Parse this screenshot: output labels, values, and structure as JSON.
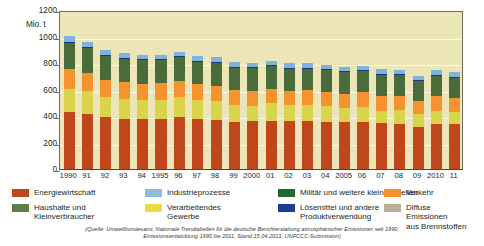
{
  "chart_data": {
    "type": "bar",
    "stacked": true,
    "title": "",
    "subtitle": "",
    "xlabel": "",
    "ylabel": "Mio. t",
    "ylim": [
      0,
      1200
    ],
    "yticks": [
      0,
      200,
      400,
      600,
      800,
      1000,
      1200
    ],
    "ytick_labels": [
      "0",
      "200",
      "400",
      "600",
      "800",
      "1000",
      "1200"
    ],
    "grid": true,
    "legend_position": "bottom",
    "categories": [
      "1990",
      "91",
      "92",
      "93",
      "94",
      "1995",
      "96",
      "97",
      "98",
      "99",
      "2000",
      "01",
      "02",
      "03",
      "04",
      "2005",
      "06",
      "07",
      "08",
      "09",
      "2010",
      "11"
    ],
    "series": [
      {
        "name": "Energiewirtschaft",
        "color": "#c0461b",
        "values": [
          428,
          416,
          392,
          380,
          381,
          378,
          389,
          378,
          372,
          352,
          359,
          366,
          362,
          364,
          358,
          352,
          357,
          345,
          340,
          318,
          337,
          340
        ]
      },
      {
        "name": "Haushalte und Kleinverbraucher",
        "color": "#d9d44a",
        "values": [
          178,
          170,
          150,
          152,
          141,
          146,
          158,
          142,
          141,
          131,
          120,
          130,
          122,
          120,
          114,
          107,
          110,
          96,
          102,
          97,
          104,
          90
        ]
      },
      {
        "name": "Verarbeitendes Gewerbe",
        "color": "#f59331",
        "values": [
          148,
          142,
          128,
          121,
          121,
          122,
          121,
          118,
          116,
          111,
          113,
          111,
          108,
          109,
          111,
          109,
          111,
          111,
          109,
          95,
          108,
          108
        ]
      },
      {
        "name": "Militär und weitere kleine Quellen",
        "color": "#4a6b3a",
        "values": [
          196,
          190,
          186,
          183,
          180,
          178,
          178,
          176,
          175,
          173,
          172,
          172,
          170,
          168,
          167,
          165,
          164,
          162,
          161,
          155,
          158,
          156
        ]
      },
      {
        "name": "Lösemittel und andere Produktverwendung",
        "color": "#1a3b7a",
        "values": [
          12,
          6,
          4,
          4,
          4,
          4,
          4,
          4,
          4,
          4,
          4,
          4,
          4,
          4,
          4,
          4,
          4,
          4,
          4,
          4,
          4,
          4
        ]
      },
      {
        "name": "Industrieprozesse",
        "color": "#7fb3dd",
        "values": [
          43,
          38,
          36,
          36,
          36,
          36,
          36,
          36,
          36,
          35,
          35,
          35,
          34,
          34,
          34,
          34,
          34,
          34,
          33,
          31,
          33,
          33
        ]
      },
      {
        "name": "Verkehr",
        "color": "#f2901f",
        "values": [
          0,
          0,
          0,
          0,
          0,
          0,
          0,
          0,
          0,
          0,
          0,
          0,
          0,
          0,
          0,
          0,
          0,
          0,
          0,
          0,
          0,
          0
        ]
      },
      {
        "name": "Diffuse Emissionen aus Brennstoffen",
        "color": "#beb69b",
        "values": [
          0,
          0,
          0,
          0,
          0,
          0,
          0,
          0,
          0,
          0,
          0,
          0,
          0,
          0,
          0,
          0,
          0,
          0,
          0,
          0,
          0,
          0
        ]
      }
    ],
    "totals": [
      1005,
      962,
      896,
      876,
      863,
      864,
      886,
      854,
      844,
      806,
      803,
      818,
      800,
      799,
      788,
      771,
      780,
      752,
      749,
      700,
      744,
      731
    ]
  },
  "axis": {
    "y_unit_label": "Mio. t"
  },
  "legend": {
    "items": [
      {
        "label": "Energiewirtschaft",
        "color": "#c0461b"
      },
      {
        "label": "Haushalte und\nKleinverbraucher",
        "color": "#5f7b4a"
      },
      {
        "label": "Industrieprozesse",
        "color": "#8fbde0"
      },
      {
        "label": "Verarbeitendes\nGewerbe",
        "color": "#e8df3f"
      },
      {
        "label": "Militär und weitere kleine Quellen",
        "color": "#1f6b33"
      },
      {
        "label": "Lösemittel und andere\nProduktverwendung",
        "color": "#1a3b8f"
      },
      {
        "label": "Verkehr",
        "color": "#f59331"
      },
      {
        "label": "Diffuse Emissionen\naus Brennstoffen",
        "color": "#b8b09a"
      }
    ]
  },
  "source": {
    "line1": "(Quelle: Umweltbundesamt, Nationale Trendtabellen für die deutsche Berichterstattung atmosphärischer Emissionen seit 1990,",
    "line2": "Emissionsentwicklung 1990 bis 2011, Stand 15.04.2013, UNFCCC-Submission)"
  },
  "colors": {
    "plot_background": "#ece5b8",
    "page_background": "#ffffff",
    "gridline": "#ffffff",
    "axis": "#6d6e55"
  }
}
